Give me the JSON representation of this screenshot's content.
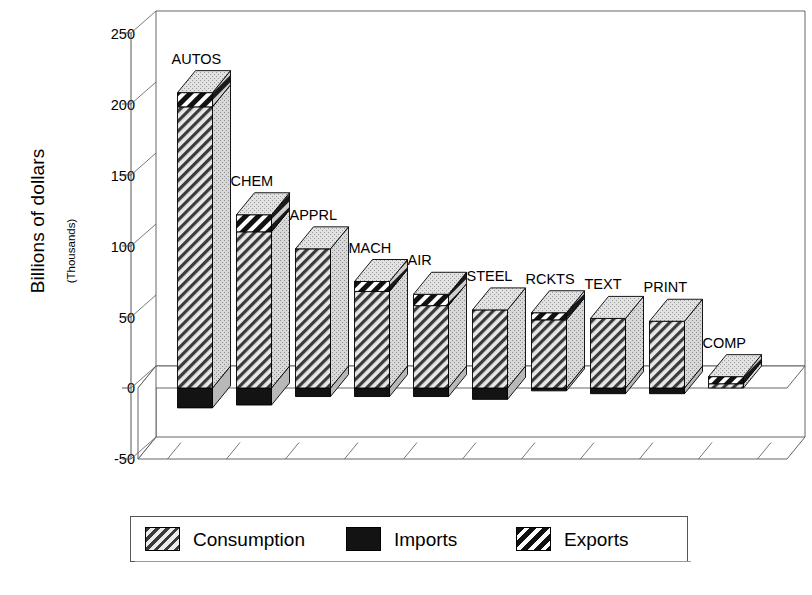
{
  "chart_data": {
    "type": "bar",
    "title": "",
    "subtitle": "",
    "xlabel": "",
    "ylabel": "Billions of dollars",
    "ylabel_sub": "(Thousands)",
    "ylim": [
      -50,
      250
    ],
    "ytick_labels": [
      "250",
      "200",
      "150",
      "100",
      "50",
      "0",
      "-50"
    ],
    "ytick_values": [
      250,
      200,
      150,
      100,
      50,
      0,
      -50
    ],
    "grid": false,
    "legend_position": "bottom",
    "stacked": true,
    "three_d": true,
    "categories": [
      "AUTOS",
      "CHEM",
      "APPRL",
      "MACH",
      "AIR",
      "STEEL",
      "RCKTS",
      "TEXT",
      "PRINT",
      "COMP"
    ],
    "series": [
      {
        "name": "Consumption",
        "style": "light-diagonal-hatch",
        "values": [
          198,
          110,
          98,
          68,
          58,
          55,
          48,
          49,
          47,
          3
        ]
      },
      {
        "name": "Imports",
        "style": "solid-black",
        "values": [
          -14,
          -12,
          -6,
          -6,
          -6,
          -8,
          -2,
          -4,
          -4,
          0
        ]
      },
      {
        "name": "Exports",
        "style": "bold-diagonal-hatch",
        "values": [
          10,
          12,
          0,
          7,
          8,
          0,
          5,
          0,
          0,
          5
        ]
      }
    ],
    "bar_totals": [
      208,
      122,
      98,
      75,
      66,
      55,
      53,
      49,
      47,
      8
    ],
    "legend_entries": [
      {
        "label": "Consumption",
        "style": "light-diagonal-hatch"
      },
      {
        "label": "Imports",
        "style": "solid-black"
      },
      {
        "label": "Exports",
        "style": "bold-diagonal-hatch"
      }
    ]
  }
}
